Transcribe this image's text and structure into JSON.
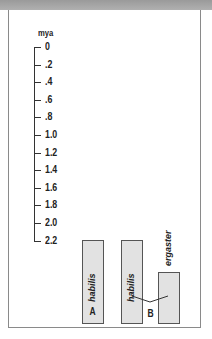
{
  "header": {
    "title": ""
  },
  "chart_data": {
    "type": "bar",
    "title": "",
    "ylabel": "mya",
    "y_ticks": [
      "0",
      ".2",
      ".4",
      ".6",
      ".8",
      "1.0",
      "1.2",
      "1.4",
      "1.6",
      "1.8",
      "2.0",
      "2.2"
    ],
    "ylim": [
      0,
      2.2
    ],
    "inverted_y": true,
    "groups": [
      {
        "label": "A",
        "bars": [
          {
            "name": "habilis",
            "start_mya": 2.2,
            "end_mya": 1.8
          }
        ]
      },
      {
        "label": "B",
        "bars": [
          {
            "name": "habilis",
            "start_mya": 2.2,
            "end_mya": 1.8
          },
          {
            "name": "ergaster",
            "start_mya": 2.2,
            "end_mya": 1.97
          }
        ]
      }
    ]
  }
}
